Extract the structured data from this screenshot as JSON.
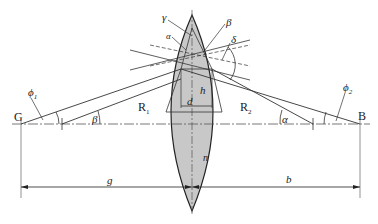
{
  "diagram": {
    "points": {
      "left": "G",
      "right": "B"
    },
    "radii": {
      "left": "R",
      "left_sub": "1",
      "right": "R",
      "right_sub": "2"
    },
    "angles": {
      "alpha_top": "α",
      "beta_top": "β",
      "gamma": "γ",
      "delta": "δ",
      "beta_axis": "β",
      "alpha_axis": "α",
      "phi1": "ϕ",
      "phi1_sub": "1",
      "phi2": "ϕ",
      "phi2_sub": "2"
    },
    "dimensions": {
      "d": "d",
      "h": "h",
      "n": "n",
      "g": "g",
      "b": "b"
    },
    "colors": {
      "lens_fill": "#c8c8c8",
      "line": "#333333"
    }
  }
}
